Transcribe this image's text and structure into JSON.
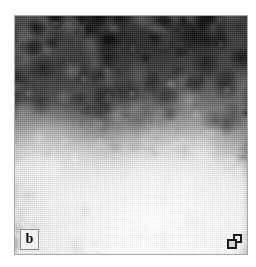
{
  "figure": {
    "type": "scanning-probe-micrograph",
    "modality": "grayscale topography scan",
    "panel_label": "b",
    "panel_label_name": "panel-label-b",
    "corner_marker_icon": "overlapping-squares-icon",
    "frame": {
      "border_color": "#a8a8a8",
      "x": 14,
      "y": 15,
      "width": 234,
      "height": 240
    },
    "canvas": {
      "background": "#ffffff",
      "width": 256,
      "height": 267
    },
    "palette": {
      "darkest": "#1e1e1e",
      "dark": "#404040",
      "mid": "#909090",
      "light": "#e0e0e0",
      "lightest": "#ffffff"
    },
    "regions": [
      {
        "name": "dark-granular-band",
        "description": "dark blobby cluster region across the upper portion",
        "tone": "dark"
      },
      {
        "name": "bright-terrace",
        "description": "bright smooth terrace occupying the lower and right-lower area",
        "tone": "light"
      },
      {
        "name": "left-bright-lobe",
        "description": "bright mid-left region",
        "tone": "light"
      },
      {
        "name": "lower-left-blobs",
        "description": "small dark blobs near the bottom-left corner",
        "tone": "dark"
      }
    ]
  }
}
